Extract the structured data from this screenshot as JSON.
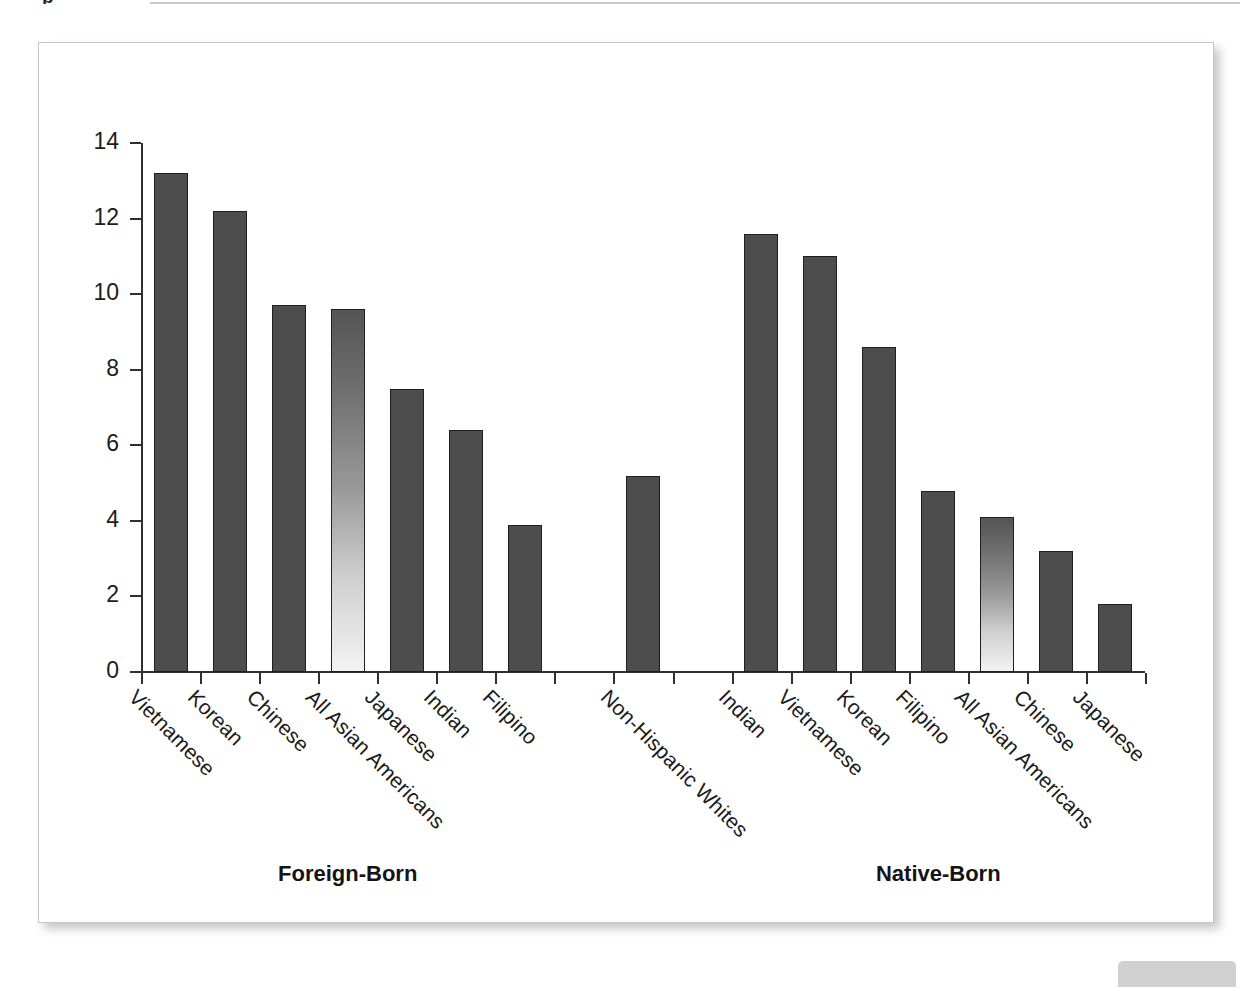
{
  "page": {
    "top_fragment": "p",
    "corner_chip_label": ""
  },
  "chart_data": {
    "type": "bar",
    "title": "",
    "subtitle": "",
    "xlabel": "",
    "ylabel": "",
    "ylim": [
      0,
      14
    ],
    "ytick_values": [
      0,
      2,
      4,
      6,
      8,
      10,
      12,
      14
    ],
    "ytick_labels": [
      "0",
      "2",
      "4",
      "6",
      "8",
      "10",
      "12",
      "14"
    ],
    "grid": false,
    "legend": false,
    "legend_position": "none",
    "orientation": "vertical",
    "bar_color": "#4d4d4d",
    "highlight_bar_color_top": "#555555",
    "highlight_bar_color_bottom": "#f3f3f3",
    "axis_color": "#2f2f2f",
    "group_labels": [
      "Foreign-Born",
      "Native-Born"
    ],
    "categories": [
      "Vietnamese",
      "Korean",
      "Chinese",
      "All Asian Americans",
      "Japanese",
      "Indian",
      "Filipino",
      "",
      "Non-Hispanic Whites",
      "",
      "Indian",
      "Vietnamese",
      "Korean",
      "Filipino",
      "All Asian Americans",
      "Chinese",
      "Japanese"
    ],
    "values": [
      13.2,
      12.2,
      9.7,
      9.6,
      7.5,
      6.4,
      3.9,
      null,
      5.2,
      null,
      11.6,
      11.0,
      8.6,
      4.8,
      4.1,
      3.2,
      1.8
    ],
    "bars": [
      {
        "label": "Vietnamese",
        "value": 13.2,
        "group": "Foreign-Born",
        "style": "solid"
      },
      {
        "label": "Korean",
        "value": 12.2,
        "group": "Foreign-Born",
        "style": "solid"
      },
      {
        "label": "Chinese",
        "value": 9.7,
        "group": "Foreign-Born",
        "style": "solid"
      },
      {
        "label": "All Asian Americans",
        "value": 9.6,
        "group": "Foreign-Born",
        "style": "gradient"
      },
      {
        "label": "Japanese",
        "value": 7.5,
        "group": "Foreign-Born",
        "style": "solid"
      },
      {
        "label": "Indian",
        "value": 6.4,
        "group": "Foreign-Born",
        "style": "solid"
      },
      {
        "label": "Filipino",
        "value": 3.9,
        "group": "Foreign-Born",
        "style": "solid"
      },
      {
        "label": "",
        "value": null,
        "group": "",
        "style": "none"
      },
      {
        "label": "Non-Hispanic Whites",
        "value": 5.2,
        "group": "",
        "style": "solid"
      },
      {
        "label": "",
        "value": null,
        "group": "",
        "style": "none"
      },
      {
        "label": "Indian",
        "value": 11.6,
        "group": "Native-Born",
        "style": "solid"
      },
      {
        "label": "Vietnamese",
        "value": 11.0,
        "group": "Native-Born",
        "style": "solid"
      },
      {
        "label": "Korean",
        "value": 8.6,
        "group": "Native-Born",
        "style": "solid"
      },
      {
        "label": "Filipino",
        "value": 4.8,
        "group": "Native-Born",
        "style": "solid"
      },
      {
        "label": "All Asian Americans",
        "value": 4.1,
        "group": "Native-Born",
        "style": "gradient"
      },
      {
        "label": "Chinese",
        "value": 3.2,
        "group": "Native-Born",
        "style": "solid"
      },
      {
        "label": "Japanese",
        "value": 1.8,
        "group": "Native-Born",
        "style": "solid"
      }
    ]
  }
}
